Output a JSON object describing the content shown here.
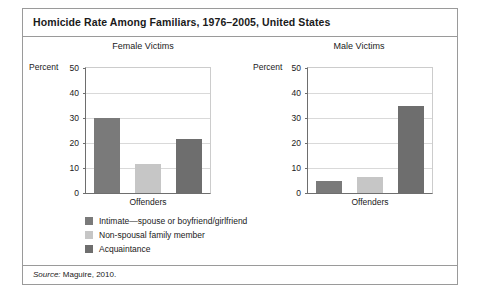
{
  "figure": {
    "title": "Homicide Rate Among Familiars, 1976–2005, United States",
    "source_label": "Source:",
    "source_text": " Maguire, 2010."
  },
  "legend": {
    "items": [
      {
        "label": "Intimate—spouse or boyfriend/girlfriend",
        "color": "#7a7a7a"
      },
      {
        "label": "Non-spousal family member",
        "color": "#c6c6c6"
      },
      {
        "label": "Acquaintance",
        "color": "#6e6e6e"
      }
    ]
  },
  "panels": {
    "left": {
      "title": "Female Victims",
      "percent_label": "Percent",
      "xlabel": "Offenders",
      "yticks": [
        "50",
        "40",
        "30",
        "20",
        "10",
        "0"
      ]
    },
    "right": {
      "title": "Male Victims",
      "percent_label": "Percent",
      "xlabel": "Offenders",
      "yticks": [
        "50",
        "40",
        "30",
        "20",
        "10",
        "0"
      ]
    }
  },
  "chart_data": [
    {
      "type": "bar",
      "title": "Female Victims",
      "categories": [
        "Intimate—spouse or boyfriend/girlfriend",
        "Non-spousal family member",
        "Acquaintance"
      ],
      "values": [
        30,
        11.5,
        21.5
      ],
      "colors": [
        "#7a7a7a",
        "#c6c6c6",
        "#6e6e6e"
      ],
      "xlabel": "Offenders",
      "ylabel": "Percent",
      "ylim": [
        0,
        50
      ],
      "yticks": [
        0,
        10,
        20,
        30,
        40,
        50
      ],
      "grid": true,
      "legend_position": "below"
    },
    {
      "type": "bar",
      "title": "Male Victims",
      "categories": [
        "Intimate—spouse or boyfriend/girlfriend",
        "Non-spousal family member",
        "Acquaintance"
      ],
      "values": [
        5,
        6.5,
        35
      ],
      "colors": [
        "#7a7a7a",
        "#c6c6c6",
        "#6e6e6e"
      ],
      "xlabel": "Offenders",
      "ylabel": "Percent",
      "ylim": [
        0,
        50
      ],
      "yticks": [
        0,
        10,
        20,
        30,
        40,
        50
      ],
      "grid": true,
      "legend_position": "below"
    }
  ]
}
